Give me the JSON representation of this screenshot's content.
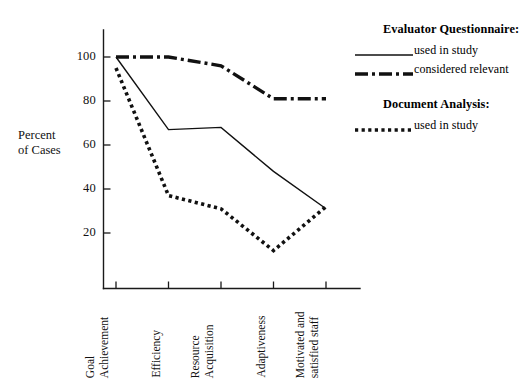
{
  "chart_data": {
    "type": "line",
    "title": "",
    "xlabel": "",
    "ylabel": "Percent of Cases",
    "ylim": [
      0,
      110
    ],
    "yticks": [
      20,
      40,
      60,
      80,
      100
    ],
    "grid": false,
    "legend_position": "right",
    "categories": [
      "Goal Achievement",
      "Efficiency",
      "Resource Acquisition",
      "Adaptiveness",
      "Motivated and satisfied staff"
    ],
    "series": [
      {
        "name": "Evaluator Questionnaire: used in study",
        "style": "solid",
        "values": [
          100,
          67,
          68,
          48,
          31
        ]
      },
      {
        "name": "Evaluator Questionnaire: considered relevant",
        "style": "dash-dot",
        "values": [
          100,
          100,
          96,
          81,
          81
        ]
      },
      {
        "name": "Document Analysis: used in study",
        "style": "dotted",
        "values": [
          95,
          37,
          31,
          12,
          32
        ]
      }
    ]
  },
  "axis": {
    "y_title_line1": "Percent",
    "y_title_line2": "of Cases",
    "y_tick_labels": [
      "100",
      "80",
      "60",
      "40",
      "20"
    ]
  },
  "categories_display": [
    {
      "line1": "Goal",
      "line2": "Achievement"
    },
    {
      "line1": "Efficiency",
      "line2": ""
    },
    {
      "line1": "Resource",
      "line2": "Acquisition"
    },
    {
      "line1": "Adaptiveness",
      "line2": ""
    },
    {
      "line1": "Motivated and",
      "line2": "satisfied staff"
    }
  ],
  "legend": {
    "groups": [
      {
        "title": "Evaluator Questionnaire:",
        "entries": [
          {
            "label": "used in study",
            "style": "solid"
          },
          {
            "label": "considered relevant",
            "style": "dash-dot"
          }
        ]
      },
      {
        "title": "Document Analysis:",
        "entries": [
          {
            "label": "used in study",
            "style": "dotted"
          }
        ]
      }
    ]
  },
  "colors": {
    "ink": "#111111",
    "background": "#ffffff"
  }
}
